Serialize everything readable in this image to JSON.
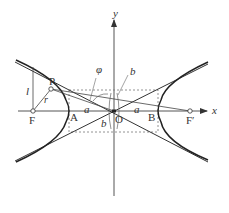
{
  "diagram": {
    "axes": {
      "x_label": "x",
      "y_label": "y"
    },
    "points": {
      "origin": "O",
      "left_vertex": "A",
      "right_vertex": "B",
      "left_focus": "F",
      "right_focus": "F′",
      "point_on_curve": "P"
    },
    "segment_labels": {
      "semi_major_left": "a",
      "semi_major_right": "a",
      "semi_minor_top": "b",
      "semi_minor_bottom": "b",
      "distance_to_directrix": "l",
      "focal_radius": "r",
      "angle": "φ"
    },
    "colors": {
      "curve": "#222222",
      "axis": "#555555",
      "dashed": "#777777",
      "text": "#333333"
    }
  }
}
